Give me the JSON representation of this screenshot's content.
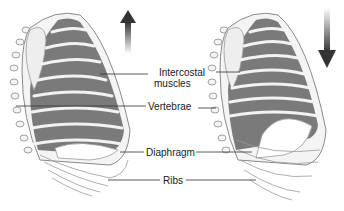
{
  "diagram": {
    "panels": [
      {
        "name": "left",
        "state": "inhalation",
        "arrow": "up-arrow"
      },
      {
        "name": "right",
        "state": "exhalation",
        "arrow": "down-arrow"
      }
    ],
    "labels": {
      "intercostal_line1": "Intercostal",
      "intercostal_line2": "muscles",
      "vertebrae": "Vertebrae",
      "diaphragm": "Diaphragm",
      "ribs": "Ribs"
    },
    "colors": {
      "muscle": "#7a7a7a",
      "rib": "#f2f2f2",
      "rib_outline": "#9a9a9a",
      "arrow_dark": "#3a3a3a",
      "leader_line": "#333333"
    }
  }
}
